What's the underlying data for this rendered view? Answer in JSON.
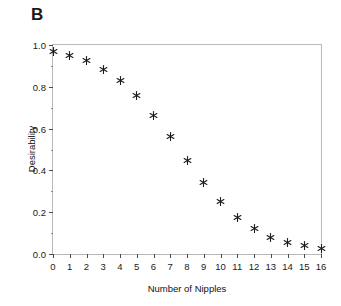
{
  "figure": {
    "panel_label": "B",
    "background_color": "#ffffff",
    "frame_color": "#b9b9b9",
    "marker_color": "#1c1c1c",
    "text_color": "#111111"
  },
  "chart_data": {
    "type": "scatter",
    "title": "B",
    "xlabel": "Number of Nipples",
    "ylabel": "Desirability",
    "xlim": [
      0,
      16
    ],
    "ylim": [
      0.0,
      1.0
    ],
    "grid": false,
    "legend": null,
    "marker": "asterisk",
    "marker_color": "#1c1c1c",
    "xticks": [
      0,
      1,
      2,
      3,
      4,
      5,
      6,
      7,
      8,
      9,
      10,
      11,
      12,
      13,
      14,
      15,
      16
    ],
    "xtick_labels": [
      "0",
      "1",
      "2",
      "3",
      "4",
      "5",
      "6",
      "7",
      "8",
      "9",
      "10",
      "11",
      "12",
      "13",
      "14",
      "15",
      "16"
    ],
    "yticks": [
      0.0,
      0.2,
      0.4,
      0.6,
      0.8,
      1.0
    ],
    "ytick_labels": [
      "0.0",
      "0.2",
      "0.4",
      "0.6",
      "0.8",
      "1.0"
    ],
    "y_minor_ticks": [
      0.1,
      0.3,
      0.5,
      0.7,
      0.9
    ],
    "x": [
      0,
      1,
      2,
      3,
      4,
      5,
      6,
      7,
      8,
      9,
      10,
      11,
      12,
      13,
      14,
      15,
      16
    ],
    "values": [
      0.97,
      0.95,
      0.925,
      0.885,
      0.83,
      0.76,
      0.665,
      0.56,
      0.445,
      0.34,
      0.25,
      0.175,
      0.12,
      0.08,
      0.055,
      0.04,
      0.025
    ],
    "points": [
      {
        "x": 0,
        "y": 0.97
      },
      {
        "x": 1,
        "y": 0.95
      },
      {
        "x": 2,
        "y": 0.925
      },
      {
        "x": 3,
        "y": 0.885
      },
      {
        "x": 4,
        "y": 0.83
      },
      {
        "x": 5,
        "y": 0.76
      },
      {
        "x": 6,
        "y": 0.665
      },
      {
        "x": 7,
        "y": 0.56
      },
      {
        "x": 8,
        "y": 0.445
      },
      {
        "x": 9,
        "y": 0.34
      },
      {
        "x": 10,
        "y": 0.25
      },
      {
        "x": 11,
        "y": 0.175
      },
      {
        "x": 12,
        "y": 0.12
      },
      {
        "x": 13,
        "y": 0.08
      },
      {
        "x": 14,
        "y": 0.055
      },
      {
        "x": 15,
        "y": 0.04
      },
      {
        "x": 16,
        "y": 0.025
      }
    ]
  }
}
